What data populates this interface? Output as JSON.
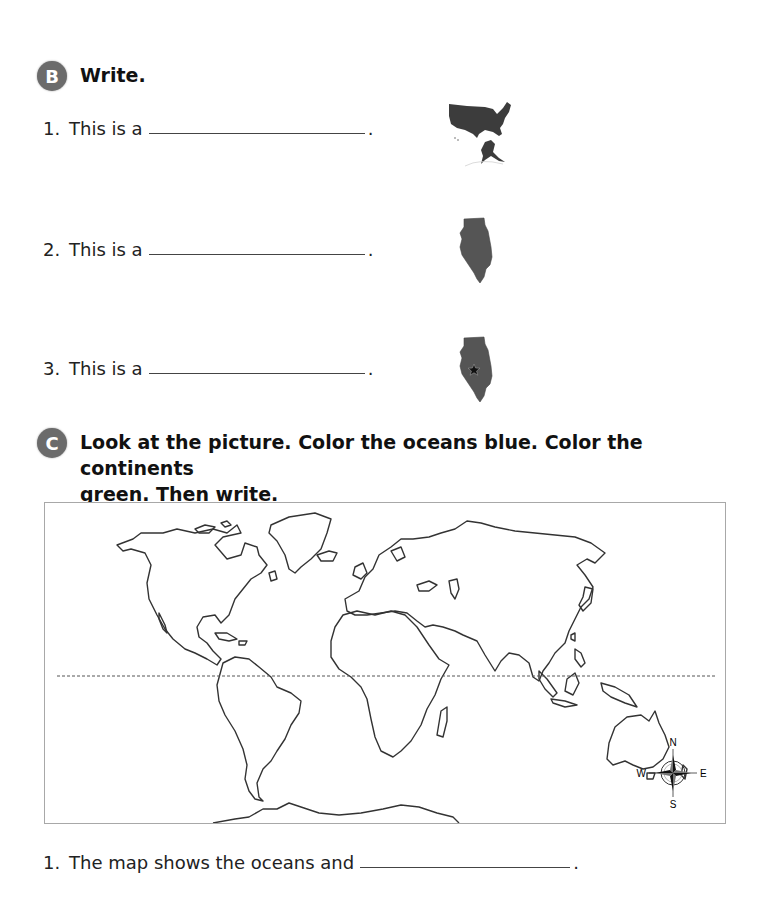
{
  "section_b": {
    "badge": "B",
    "instruction": "Write.",
    "items": [
      {
        "number": "1.",
        "prompt": "This is a",
        "end": ".",
        "picture": "united-states-map"
      },
      {
        "number": "2.",
        "prompt": "This is a",
        "end": ".",
        "picture": "illinois-state-map"
      },
      {
        "number": "3.",
        "prompt": "This is a",
        "end": ".",
        "picture": "illinois-capital-star-map"
      }
    ]
  },
  "section_c": {
    "badge": "C",
    "instruction_line1": "Look at the picture. Color the oceans blue. Color the continents",
    "instruction_line2": "green. Then write.",
    "map": {
      "subject": "world-outline-map",
      "equator_line": "dashed",
      "compass": {
        "n": "N",
        "s": "S",
        "e": "E",
        "w": "W"
      }
    },
    "items": [
      {
        "number": "1.",
        "prompt": "The map shows the oceans and",
        "end": "."
      }
    ]
  },
  "colors": {
    "badge": "#6b6b6b",
    "map_fill": "#4a4a4a",
    "outline": "#333333"
  }
}
